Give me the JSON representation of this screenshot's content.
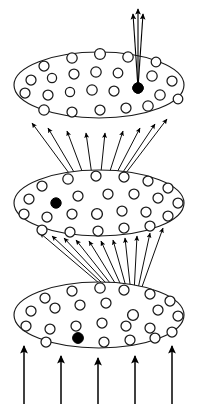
{
  "figure": {
    "title": "Hierarchical three-layer fan-in / fan-out diagram",
    "background_color": "#ffffff",
    "stroke_color": "#1a1a1a",
    "fill_marked_color": "#000000",
    "width": 197,
    "height": 408
  },
  "chart_data": {
    "type": "diagram",
    "title": "Hierarchical three-layer fan-in / fan-out diagram",
    "xlabel": "",
    "ylabel": "",
    "grid": false,
    "legend": null,
    "layers": [
      {
        "name": "top-layer",
        "label": "Top layer",
        "index": 3,
        "ellipse": {
          "cx": 99,
          "cy": 85,
          "rx": 85,
          "ry": 33
        },
        "marked_unit": {
          "cx": 138,
          "cy": 88,
          "r": 5.2,
          "style": "filled"
        },
        "units": [
          {
            "cx": 44,
            "cy": 66,
            "r": 5.0
          },
          {
            "cx": 72,
            "cy": 58,
            "r": 5.2
          },
          {
            "cx": 100,
            "cy": 54,
            "r": 5.4
          },
          {
            "cx": 128,
            "cy": 57,
            "r": 5.2
          },
          {
            "cx": 156,
            "cy": 62,
            "r": 4.8
          },
          {
            "cx": 31,
            "cy": 80,
            "r": 5.0
          },
          {
            "cx": 52,
            "cy": 78,
            "r": 4.6
          },
          {
            "cx": 74,
            "cy": 74,
            "r": 5.0
          },
          {
            "cx": 96,
            "cy": 72,
            "r": 5.2
          },
          {
            "cx": 118,
            "cy": 73,
            "r": 4.8
          },
          {
            "cx": 152,
            "cy": 76,
            "r": 5.2
          },
          {
            "cx": 172,
            "cy": 81,
            "r": 5.0
          },
          {
            "cx": 25,
            "cy": 93,
            "r": 5.0
          },
          {
            "cx": 48,
            "cy": 95,
            "r": 5.0
          },
          {
            "cx": 70,
            "cy": 92,
            "r": 4.6
          },
          {
            "cx": 92,
            "cy": 90,
            "r": 5.2
          },
          {
            "cx": 114,
            "cy": 91,
            "r": 5.0
          },
          {
            "cx": 160,
            "cy": 95,
            "r": 5.2
          },
          {
            "cx": 178,
            "cy": 99,
            "r": 4.8
          },
          {
            "cx": 44,
            "cy": 110,
            "r": 5.2
          },
          {
            "cx": 72,
            "cy": 112,
            "r": 5.0
          },
          {
            "cx": 100,
            "cy": 110,
            "r": 5.0
          },
          {
            "cx": 126,
            "cy": 108,
            "r": 5.0
          },
          {
            "cx": 148,
            "cy": 106,
            "r": 5.2
          }
        ]
      },
      {
        "name": "middle-layer",
        "label": "Middle layer",
        "index": 2,
        "ellipse": {
          "cx": 99,
          "cy": 203,
          "rx": 85,
          "ry": 33
        },
        "marked_unit": {
          "cx": 56,
          "cy": 203,
          "r": 5.2,
          "style": "filled"
        },
        "source_unit": {
          "cx": 97,
          "cy": 214,
          "r": 5.4,
          "style": "open"
        },
        "units": [
          {
            "cx": 42,
            "cy": 186,
            "r": 5.0
          },
          {
            "cx": 68,
            "cy": 179,
            "r": 5.2
          },
          {
            "cx": 96,
            "cy": 176,
            "r": 5.0
          },
          {
            "cx": 124,
            "cy": 177,
            "r": 5.0
          },
          {
            "cx": 148,
            "cy": 181,
            "r": 5.0
          },
          {
            "cx": 168,
            "cy": 188,
            "r": 5.0
          },
          {
            "cx": 29,
            "cy": 199,
            "r": 5.0
          },
          {
            "cx": 78,
            "cy": 196,
            "r": 5.0
          },
          {
            "cx": 108,
            "cy": 194,
            "r": 5.0
          },
          {
            "cx": 134,
            "cy": 194,
            "r": 5.0
          },
          {
            "cx": 158,
            "cy": 198,
            "r": 5.0
          },
          {
            "cx": 178,
            "cy": 203,
            "r": 5.0
          },
          {
            "cx": 24,
            "cy": 214,
            "r": 5.0
          },
          {
            "cx": 47,
            "cy": 217,
            "r": 5.0
          },
          {
            "cx": 72,
            "cy": 214,
            "r": 5.0
          },
          {
            "cx": 122,
            "cy": 211,
            "r": 5.0
          },
          {
            "cx": 146,
            "cy": 212,
            "r": 5.0
          },
          {
            "cx": 168,
            "cy": 216,
            "r": 5.0
          },
          {
            "cx": 42,
            "cy": 230,
            "r": 5.0
          },
          {
            "cx": 70,
            "cy": 232,
            "r": 5.0
          },
          {
            "cx": 98,
            "cy": 231,
            "r": 5.0
          },
          {
            "cx": 124,
            "cy": 228,
            "r": 5.0
          },
          {
            "cx": 150,
            "cy": 226,
            "r": 5.0
          }
        ]
      },
      {
        "name": "bottom-layer",
        "label": "Bottom layer",
        "index": 1,
        "ellipse": {
          "cx": 99,
          "cy": 315,
          "rx": 85,
          "ry": 33
        },
        "marked_unit": {
          "cx": 78,
          "cy": 338,
          "r": 5.4,
          "style": "filled"
        },
        "source_unit": {
          "cx": 133,
          "cy": 315,
          "r": 5.4,
          "style": "open"
        },
        "units": [
          {
            "cx": 45,
            "cy": 298,
            "r": 5.0
          },
          {
            "cx": 72,
            "cy": 291,
            "r": 5.0
          },
          {
            "cx": 100,
            "cy": 288,
            "r": 5.2
          },
          {
            "cx": 124,
            "cy": 290,
            "r": 5.0
          },
          {
            "cx": 150,
            "cy": 294,
            "r": 5.0
          },
          {
            "cx": 170,
            "cy": 301,
            "r": 5.0
          },
          {
            "cx": 31,
            "cy": 311,
            "r": 5.0
          },
          {
            "cx": 55,
            "cy": 308,
            "r": 5.0
          },
          {
            "cx": 80,
            "cy": 305,
            "r": 5.0
          },
          {
            "cx": 106,
            "cy": 303,
            "r": 5.0
          },
          {
            "cx": 158,
            "cy": 310,
            "r": 5.0
          },
          {
            "cx": 178,
            "cy": 316,
            "r": 5.0
          },
          {
            "cx": 26,
            "cy": 326,
            "r": 5.0
          },
          {
            "cx": 50,
            "cy": 329,
            "r": 5.0
          },
          {
            "cx": 76,
            "cy": 326,
            "r": 5.0
          },
          {
            "cx": 102,
            "cy": 323,
            "r": 5.0
          },
          {
            "cx": 126,
            "cy": 326,
            "r": 5.0
          },
          {
            "cx": 150,
            "cy": 328,
            "r": 5.0
          },
          {
            "cx": 172,
            "cy": 332,
            "r": 5.0
          },
          {
            "cx": 46,
            "cy": 342,
            "r": 5.0
          },
          {
            "cx": 104,
            "cy": 342,
            "r": 5.0
          },
          {
            "cx": 130,
            "cy": 340,
            "r": 5.0
          },
          {
            "cx": 155,
            "cy": 338,
            "r": 5.0
          }
        ]
      }
    ],
    "connections": [
      {
        "name": "bottom-to-middle",
        "from_layer": "bottom-layer",
        "to_layer": "middle-layer",
        "origin": {
          "x": 133,
          "y": 312
        },
        "count": 11,
        "targets": [
          {
            "x": 40,
            "y": 233
          },
          {
            "x": 52,
            "y": 236
          },
          {
            "x": 64,
            "y": 238
          },
          {
            "x": 76,
            "y": 240
          },
          {
            "x": 89,
            "y": 241
          },
          {
            "x": 101,
            "y": 241
          },
          {
            "x": 113,
            "y": 240
          },
          {
            "x": 125,
            "y": 238
          },
          {
            "x": 137,
            "y": 236
          },
          {
            "x": 150,
            "y": 233
          },
          {
            "x": 163,
            "y": 228
          }
        ]
      },
      {
        "name": "middle-to-top",
        "from_layer": "middle-layer",
        "to_layer": "top-layer",
        "origin": {
          "x": 97,
          "y": 211
        },
        "count": 9,
        "targets": [
          {
            "x": 32,
            "y": 123
          },
          {
            "x": 48,
            "y": 128
          },
          {
            "x": 67,
            "y": 131
          },
          {
            "x": 86,
            "y": 133
          },
          {
            "x": 105,
            "y": 133
          },
          {
            "x": 123,
            "y": 131
          },
          {
            "x": 140,
            "y": 128
          },
          {
            "x": 155,
            "y": 124
          },
          {
            "x": 167,
            "y": 119
          }
        ]
      }
    ],
    "input_arrows": {
      "name": "input-arrows",
      "count": 5,
      "direction": "up",
      "arrows": [
        {
          "x": 24,
          "y_start": 404,
          "y_end": 346
        },
        {
          "x": 61,
          "y_start": 404,
          "y_end": 356
        },
        {
          "x": 98,
          "y_start": 404,
          "y_end": 358
        },
        {
          "x": 135,
          "y_start": 404,
          "y_end": 356
        },
        {
          "x": 172,
          "y_start": 404,
          "y_end": 346
        }
      ]
    },
    "output_arrows": {
      "name": "output-arrows",
      "count": 3,
      "direction": "up",
      "origin": {
        "x": 138,
        "y": 88
      },
      "arrows": [
        {
          "x_start": 138,
          "y_start": 88,
          "x_end": 133,
          "y_end": 14
        },
        {
          "x_start": 138,
          "y_start": 88,
          "x_end": 138,
          "y_end": 9
        },
        {
          "x_start": 138,
          "y_start": 88,
          "x_end": 143,
          "y_end": 14
        }
      ]
    }
  }
}
